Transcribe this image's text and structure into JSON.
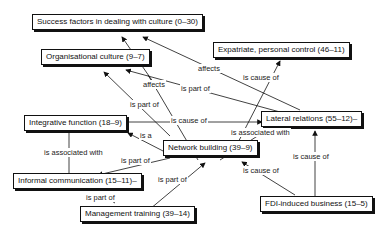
{
  "nodes": {
    "success": "Success factors in dealing with culture (0–30)",
    "orgculture": "Organisational culture (9–7)",
    "expatriate": "Expatriate, personal control (46–11)",
    "lateral": "Lateral relations (55–12)–",
    "integrative": "Integrative function (18–9)",
    "network": "Network building (39–9)",
    "informal": "Informal communication (15–11)–",
    "fdi": "FDI-induced business (15–5)",
    "mgmt": "Management training (39–14)"
  },
  "edge_labels": {
    "affects_lat_success": "affects",
    "affects_net_org": "affects",
    "ispartof_lat_org": "is part of",
    "ispartof_int_org": "is part of",
    "iscauseof_int_lat": "is cause of",
    "iscauseof_net_exp": "is cause of",
    "isa_net_int": "is a",
    "isassoc_net_lat": "is associated with",
    "isassoc_int_inf": "is associated with",
    "ispartof_net_inf": "is part of",
    "ispartof_mgmt_net": "is part of",
    "ispartof_mgmt_inf": "is part of",
    "iscauseof_fdi_net": "is cause of",
    "iscauseof_fdi_lat": "is cause of"
  }
}
